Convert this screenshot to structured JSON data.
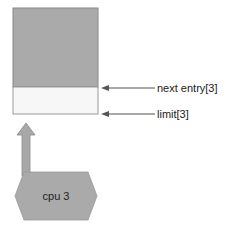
{
  "diagram": {
    "memory_block": {
      "filled_color": "#aaaaaa",
      "empty_color": "#f7f7f7",
      "border_color": "#888888"
    },
    "pointers": [
      {
        "label": "next entry[3]"
      },
      {
        "label": "limit[3]"
      }
    ],
    "cpu": {
      "label": "cpu 3",
      "fill": "#aaaaaa"
    },
    "arrow_color": "#666666"
  }
}
